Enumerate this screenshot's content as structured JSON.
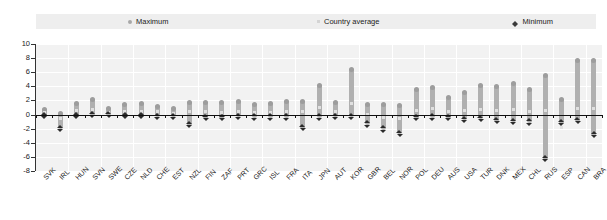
{
  "legend": {
    "items": [
      {
        "label": "Maximum",
        "icon": "circle-marker",
        "color": "#a8a8a8"
      },
      {
        "label": "Country average",
        "icon": "square-marker",
        "color": "#d4d4d4"
      },
      {
        "label": "Minimum",
        "icon": "diamond-marker",
        "color": "#3a3a3a"
      }
    ]
  },
  "axis": {
    "y_ticks": [
      "10",
      "8",
      "6",
      "4",
      "2",
      "0",
      "-2",
      "-4",
      "-6",
      "-8"
    ]
  },
  "chart_data": {
    "type": "bar",
    "title": "",
    "subtitle": "",
    "xlabel": "",
    "ylabel": "",
    "ylim": [
      -8,
      10
    ],
    "ytick_step": 2,
    "grid": true,
    "legend_position": "top",
    "categories": [
      "SVK",
      "IRL",
      "HUN",
      "SVN",
      "SWE",
      "CZE",
      "NLD",
      "CHE",
      "EST",
      "NZL",
      "FIN",
      "ZAF",
      "PRT",
      "GRC",
      "ISL",
      "FRA",
      "ITA",
      "JPN",
      "AUT",
      "KOR",
      "GBR",
      "BEL",
      "NOR",
      "POL",
      "DEU",
      "AUS",
      "USA",
      "TUR",
      "DNK",
      "MEX",
      "CHL",
      "RUS",
      "ESP",
      "CAN",
      "BRA"
    ],
    "series": [
      {
        "name": "Maximum",
        "values": [
          1.0,
          0.3,
          1.8,
          2.4,
          1.1,
          1.6,
          1.8,
          1.4,
          1.1,
          1.9,
          1.9,
          1.9,
          2.1,
          1.7,
          1.8,
          2.0,
          2.0,
          4.4,
          1.9,
          6.6,
          1.7,
          1.6,
          1.5,
          3.8,
          4.0,
          2.7,
          3.4,
          4.4,
          4.2,
          4.6,
          3.8,
          5.8,
          2.3,
          7.9,
          7.9
        ]
      },
      {
        "name": "Country average",
        "values": [
          0.3,
          -0.6,
          0.6,
          0.7,
          0.3,
          0.5,
          0.5,
          0.4,
          0.2,
          0.4,
          0.5,
          0.3,
          0.4,
          0.3,
          0.3,
          0.4,
          0.4,
          1.0,
          0.4,
          1.6,
          0.0,
          -0.4,
          -0.5,
          0.6,
          0.8,
          0.4,
          0.6,
          0.7,
          0.6,
          0.7,
          0.4,
          0.6,
          -1.8,
          0.9,
          0.8
        ]
      },
      {
        "name": "Minimum",
        "values": [
          -0.3,
          -2.1,
          -0.3,
          -0.2,
          -0.2,
          -0.3,
          -0.3,
          -0.4,
          -0.4,
          -1.6,
          -0.6,
          -0.6,
          -0.4,
          -0.5,
          -0.5,
          -0.5,
          -2.0,
          -0.5,
          -0.4,
          -0.4,
          -1.5,
          -2.2,
          -2.8,
          -0.6,
          -0.5,
          -0.6,
          -0.8,
          -0.7,
          -1.0,
          -1.1,
          -1.2,
          -6.4,
          -1.3,
          -1.0,
          -3.0
        ]
      }
    ]
  }
}
